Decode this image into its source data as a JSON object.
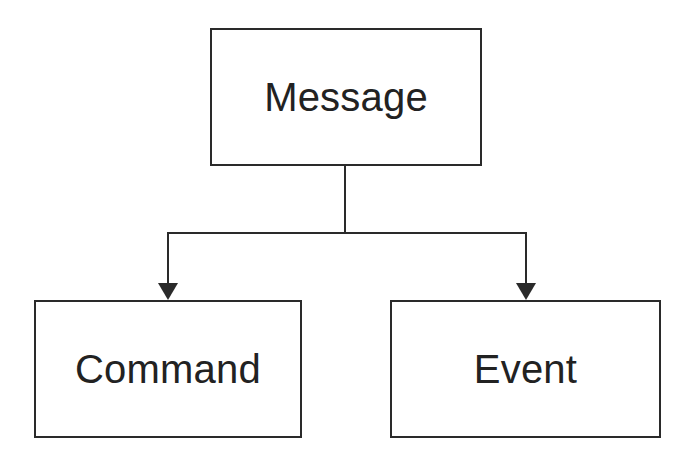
{
  "diagram": {
    "type": "hierarchy",
    "nodes": [
      {
        "id": "message",
        "label": "Message"
      },
      {
        "id": "command",
        "label": "Command"
      },
      {
        "id": "event",
        "label": "Event"
      }
    ],
    "edges": [
      {
        "from": "message",
        "to": "command",
        "style": "arrow"
      },
      {
        "from": "message",
        "to": "event",
        "style": "arrow"
      }
    ],
    "colors": {
      "stroke": "#2a2a2a",
      "text": "#222222",
      "background": "#ffffff"
    }
  }
}
